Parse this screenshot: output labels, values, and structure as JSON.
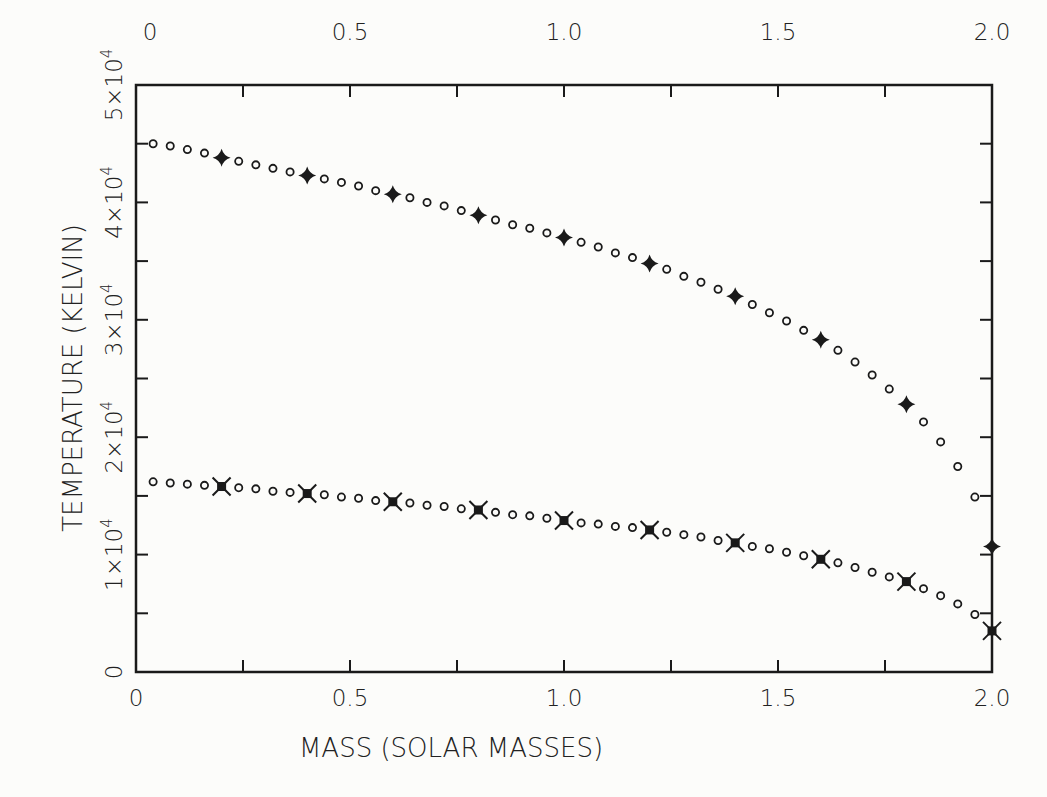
{
  "chart_data": {
    "type": "scatter",
    "title": "",
    "xlabel": "MASS (SOLAR MASSES)",
    "ylabel": "TEMPERATURE (KELVIN)",
    "xlim": [
      0,
      2.0
    ],
    "ylim": [
      0,
      50000
    ],
    "grid": false,
    "legend": null,
    "x_ticks_major": [
      0,
      0.5,
      1.0,
      1.5,
      2.0
    ],
    "x_tick_labels_bottom": [
      "0",
      "0.5",
      "1.0",
      "1.5",
      "2.0"
    ],
    "x_tick_labels_top": [
      "0",
      "0.5",
      "1.0",
      "1.5",
      "2.0"
    ],
    "x_ticks_minor_step": 0.25,
    "y_ticks_major": [
      0,
      10000,
      20000,
      30000,
      40000,
      50000
    ],
    "y_tick_labels": [
      {
        "base": "0",
        "exp": ""
      },
      {
        "base": "1×10",
        "exp": "4"
      },
      {
        "base": "2×10",
        "exp": "4"
      },
      {
        "base": "3×10",
        "exp": "4"
      },
      {
        "base": "4×10",
        "exp": "4"
      },
      {
        "base": "5×10",
        "exp": "4"
      }
    ],
    "y_ticks_minor_step": 5000,
    "x": [
      0.04,
      0.08,
      0.12,
      0.16,
      0.2,
      0.24,
      0.28,
      0.32,
      0.36,
      0.4,
      0.44,
      0.48,
      0.52,
      0.56,
      0.6,
      0.64,
      0.68,
      0.72,
      0.76,
      0.8,
      0.84,
      0.88,
      0.92,
      0.96,
      1.0,
      1.04,
      1.08,
      1.12,
      1.16,
      1.2,
      1.24,
      1.28,
      1.32,
      1.36,
      1.4,
      1.44,
      1.48,
      1.52,
      1.56,
      1.6,
      1.64,
      1.68,
      1.72,
      1.76,
      1.8,
      1.84,
      1.88,
      1.92,
      1.96,
      2.0
    ],
    "series": [
      {
        "name": "upper",
        "marker": "open-circle",
        "highlight_marker": "filled-four-point-star",
        "highlight_every_mass": 0.2,
        "values": [
          45000,
          44800,
          44500,
          44200,
          43800,
          43500,
          43200,
          42900,
          42600,
          42300,
          42000,
          41700,
          41400,
          41000,
          40700,
          40400,
          40000,
          39700,
          39300,
          38900,
          38500,
          38100,
          37800,
          37400,
          37000,
          36600,
          36200,
          35700,
          35300,
          34800,
          34300,
          33700,
          33200,
          32600,
          32000,
          31300,
          30600,
          29900,
          29100,
          28300,
          27400,
          26400,
          25300,
          24100,
          22800,
          21300,
          19600,
          17500,
          14900,
          10700
        ]
      },
      {
        "name": "lower",
        "marker": "open-circle",
        "highlight_marker": "filled-square-star",
        "highlight_every_mass": 0.2,
        "values": [
          16200,
          16100,
          16000,
          15900,
          15800,
          15700,
          15600,
          15400,
          15300,
          15200,
          15100,
          14900,
          14800,
          14600,
          14500,
          14400,
          14200,
          14100,
          13900,
          13800,
          13600,
          13400,
          13300,
          13100,
          12900,
          12700,
          12600,
          12400,
          12300,
          12100,
          11900,
          11700,
          11500,
          11200,
          11000,
          10700,
          10500,
          10200,
          9900,
          9600,
          9300,
          8900,
          8500,
          8100,
          7700,
          7100,
          6500,
          5800,
          4900,
          3500
        ]
      }
    ]
  },
  "colors": {
    "ink": "#1a1a1a",
    "background": "#fcfcfa"
  }
}
